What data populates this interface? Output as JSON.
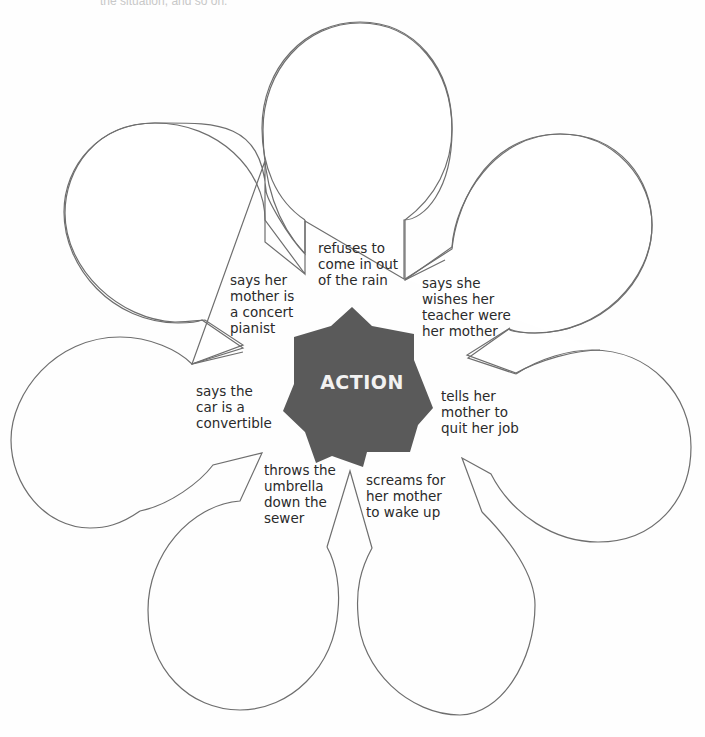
{
  "header": {
    "cut_off_text": "the situation, and so on."
  },
  "diagram": {
    "title": "ACTION",
    "center_color": "#5a5a5a",
    "outline_color": "#6e6e6e",
    "balloons": [
      {
        "position": "top",
        "label": "refuses to\ncome in out\nof the rain"
      },
      {
        "position": "upper-right",
        "label": "says she\nwishes her\nteacher were\nher mother"
      },
      {
        "position": "right",
        "label": "tells her\nmother to\nquit her job"
      },
      {
        "position": "lower-right",
        "label": "screams for\nher mother\nto wake up"
      },
      {
        "position": "lower-left",
        "label": "throws the\numbrella\ndown the\nsewer"
      },
      {
        "position": "left",
        "label": "says the\ncar is a\nconvertible"
      },
      {
        "position": "upper-left",
        "label": "says her\nmother is\na concert\npianist"
      }
    ]
  }
}
